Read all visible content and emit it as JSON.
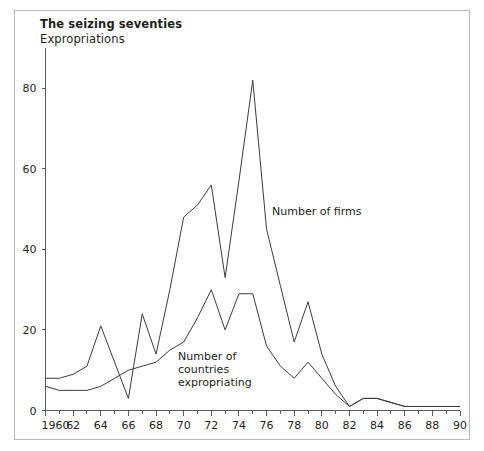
{
  "figure": {
    "title": "The seizing seventies",
    "subtitle": "Expropriations"
  },
  "annotations": {
    "firms": "Number of firms",
    "countries_line1": "Number of",
    "countries_line2": "countries",
    "countries_line3": "expropriating"
  },
  "chart_data": {
    "type": "line",
    "title": "The seizing seventies",
    "subtitle": "Expropriations",
    "xlabel": "",
    "ylabel": "",
    "xlim": [
      1960,
      1990
    ],
    "ylim": [
      0,
      90
    ],
    "grid": false,
    "legend": "inline-annotations",
    "x_tick_labels": [
      "1960",
      "62",
      "64",
      "66",
      "68",
      "70",
      "72",
      "74",
      "76",
      "78",
      "80",
      "82",
      "84",
      "86",
      "88",
      "90"
    ],
    "x_tick_values": [
      1960,
      1962,
      1964,
      1966,
      1968,
      1970,
      1972,
      1974,
      1976,
      1978,
      1980,
      1982,
      1984,
      1986,
      1988,
      1990
    ],
    "x_minor_ticks": [
      1961,
      1963,
      1965,
      1967,
      1969,
      1971,
      1973,
      1975,
      1977,
      1979,
      1981,
      1983,
      1985,
      1987,
      1989
    ],
    "y_tick_labels": [
      "0",
      "20",
      "40",
      "60",
      "80"
    ],
    "y_tick_values": [
      0,
      20,
      40,
      60,
      80
    ],
    "x": [
      1960,
      1961,
      1962,
      1963,
      1964,
      1965,
      1966,
      1967,
      1968,
      1969,
      1970,
      1971,
      1972,
      1973,
      1974,
      1975,
      1976,
      1977,
      1978,
      1979,
      1980,
      1981,
      1982,
      1983,
      1984,
      1985,
      1986,
      1987,
      1988,
      1989,
      1990
    ],
    "series": [
      {
        "name": "Number of firms",
        "values": [
          8,
          8,
          9,
          11,
          21,
          12,
          3,
          24,
          14,
          30,
          48,
          51,
          56,
          33,
          57,
          82,
          45,
          31,
          17,
          27,
          14,
          6,
          1,
          3,
          3,
          2,
          1,
          1,
          1,
          1,
          1
        ]
      },
      {
        "name": "Number of countries expropriating",
        "values": [
          6,
          5,
          5,
          5,
          6,
          8,
          10,
          11,
          12,
          15,
          17,
          23,
          30,
          20,
          29,
          29,
          16,
          11,
          8,
          12,
          8,
          4,
          1,
          3,
          3,
          2,
          1,
          1,
          1,
          1,
          1
        ]
      }
    ]
  }
}
